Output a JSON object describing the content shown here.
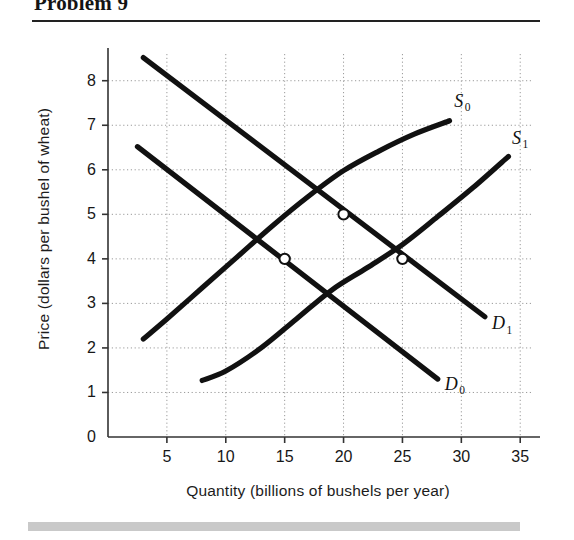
{
  "header": {
    "title": "Problem 9"
  },
  "chart_data": {
    "type": "line",
    "title": "",
    "xlabel": "Quantity (billions of bushels per year)",
    "ylabel": "Price (dollars per bushel of wheat)",
    "xlim": [
      0,
      36
    ],
    "ylim": [
      0,
      8.6
    ],
    "xticks": [
      5,
      10,
      15,
      20,
      25,
      30,
      35
    ],
    "yticks": [
      0,
      1,
      2,
      3,
      4,
      5,
      6,
      7,
      8
    ],
    "grid": true,
    "grid_style": "dotted",
    "legend": "inline-curve-labels",
    "origin_label": "0",
    "series": [
      {
        "name": "S0",
        "label": "S",
        "sublabel": "0",
        "kind": "supply",
        "points": [
          [
            3,
            2.2
          ],
          [
            5,
            2.65
          ],
          [
            8,
            3.35
          ],
          [
            11,
            4.05
          ],
          [
            14,
            4.75
          ],
          [
            17,
            5.4
          ],
          [
            20,
            5.98
          ],
          [
            23,
            6.42
          ],
          [
            26,
            6.8
          ],
          [
            29,
            7.1
          ]
        ],
        "label_pos": [
          29.4,
          7.55
        ]
      },
      {
        "name": "S1",
        "label": "S",
        "sublabel": "1",
        "kind": "supply",
        "points": [
          [
            8,
            1.27
          ],
          [
            10,
            1.48
          ],
          [
            13,
            2.0
          ],
          [
            16,
            2.65
          ],
          [
            19,
            3.3
          ],
          [
            22,
            3.8
          ],
          [
            25,
            4.32
          ],
          [
            28,
            4.95
          ],
          [
            31,
            5.6
          ],
          [
            34,
            6.3
          ]
        ],
        "label_pos": [
          34.3,
          6.72
        ]
      },
      {
        "name": "D0",
        "label": "D",
        "sublabel": "0",
        "kind": "demand",
        "points": [
          [
            2.5,
            6.52
          ],
          [
            28,
            1.3
          ]
        ],
        "label_pos": [
          28.6,
          1.2
        ]
      },
      {
        "name": "D1",
        "label": "D",
        "sublabel": "1",
        "kind": "demand",
        "points": [
          [
            3.0,
            8.52
          ],
          [
            32,
            2.7
          ]
        ],
        "label_pos": [
          32.6,
          2.55
        ]
      }
    ],
    "equilibria": [
      {
        "name": "equilibrium-a",
        "x": 15,
        "y": 4
      },
      {
        "name": "equilibrium-b",
        "x": 20,
        "y": 5
      },
      {
        "name": "equilibrium-c",
        "x": 25,
        "y": 4
      }
    ],
    "colors": {
      "curve": "#111111",
      "axis": "#333333",
      "grid": "#9a9a9a",
      "marker_fill": "#ffffff",
      "footer_bar": "#c9c9c9"
    }
  }
}
